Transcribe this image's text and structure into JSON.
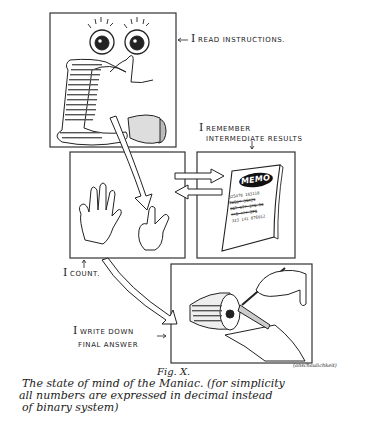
{
  "figure": {
    "title": "Fig. X.",
    "caption_lines": [
      "The state of mind of the Maniac. (for simplicity",
      "all numbers are expressed in decimal instead",
      "of binary system)"
    ],
    "caption_annotation": "(anschaulichkeit)"
  },
  "panels": [
    {
      "id": "read",
      "label": "I read instructions.",
      "content": "eyes reading an unrolling paper scroll of numbers"
    },
    {
      "id": "count",
      "label": "I count.",
      "content": "two hands counting on fingers"
    },
    {
      "id": "remember",
      "label": "I remember intermediate results",
      "content": "memo pad",
      "memo_title": "MEMO",
      "memo_lines": [
        "325478 103118",
        "7250? 36A21",
        "367 97? 3?6 53",
        "??6 ??? 575",
        "333 141 876012"
      ]
    },
    {
      "id": "write",
      "label": "I write down final answer",
      "content": "hand with pen writing on paper tape drum"
    }
  ],
  "labels": {
    "read": {
      "cap": "I",
      "rest": "read instructions."
    },
    "remember_line1": {
      "cap": "I",
      "rest": "remember"
    },
    "remember_line2": "intermediate results",
    "count": {
      "cap": "I",
      "rest": "count."
    },
    "write_line1": {
      "cap": "I",
      "rest": "write down"
    },
    "write_line2": "final answer"
  },
  "arrows": {
    "left": "←",
    "right": "→",
    "down": "↓",
    "up": "↑"
  }
}
